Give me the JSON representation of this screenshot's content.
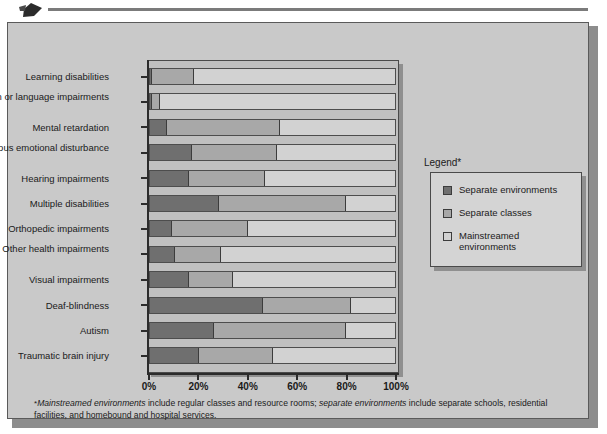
{
  "figure": {
    "legend_title": "Legend*",
    "footnote_parts": {
      "star": "*",
      "i1": "Mainstreamed environments",
      "t1": " include regular classes and resource rooms; ",
      "i2": "separate environments",
      "t2": " include separate schools, residential facilities, and homebound and hospital services."
    }
  },
  "colors": {
    "separate_environments": "#6f6f6f",
    "separate_classes": "#a8a8a8",
    "mainstreamed_environments": "#d2d2d2",
    "panel_background": "#c9c9c9",
    "plot_background": "#c0c0c0",
    "axis": "#2b2b2b"
  },
  "chart_data": {
    "type": "bar",
    "orientation": "horizontal",
    "stacked": true,
    "stack_mode": "percent",
    "title": "",
    "xlabel": "",
    "ylabel": "",
    "xlim": [
      0,
      100
    ],
    "xticks": [
      0,
      20,
      40,
      60,
      80,
      100
    ],
    "xticklabels": [
      "0%",
      "20%",
      "40%",
      "60%",
      "80%",
      "100%"
    ],
    "grid": false,
    "legend_position": "right",
    "categories": [
      "Learning disabilities",
      "Speech or language impairments",
      "Mental retardation",
      "Serious emotional disturbance",
      "Hearing impairments",
      "Multiple disabilities",
      "Orthopedic impairments",
      "Other health impairments",
      "Visual impairments",
      "Deaf-blindness",
      "Autism",
      "Traumatic brain injury"
    ],
    "series": [
      {
        "name": "Separate environments",
        "color": "#6f6f6f",
        "values": [
          1,
          1,
          7,
          17,
          16,
          28,
          9,
          10,
          16,
          46,
          26,
          20
        ]
      },
      {
        "name": "Separate classes",
        "color": "#a8a8a8",
        "values": [
          17,
          3,
          46,
          35,
          31,
          52,
          31,
          19,
          18,
          36,
          54,
          30
        ]
      },
      {
        "name": "Mainstreamed environments",
        "color": "#d2d2d2",
        "values": [
          82,
          96,
          47,
          48,
          53,
          20,
          60,
          71,
          66,
          18,
          20,
          50
        ]
      }
    ]
  },
  "legend": {
    "items": [
      {
        "label": "Separate environments",
        "color": "#6f6f6f"
      },
      {
        "label": "Separate classes",
        "color": "#a8a8a8"
      },
      {
        "label": "Mainstreamed environments",
        "color": "#d2d2d2"
      }
    ]
  }
}
